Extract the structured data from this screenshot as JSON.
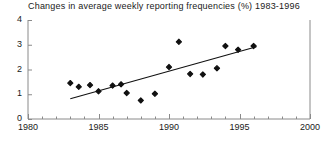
{
  "chart_data": {
    "type": "scatter",
    "title": "Changes in average weekly reporting frequencies (%) 1983-1996",
    "xlabel": "",
    "ylabel": "",
    "xlim": [
      1980,
      2000
    ],
    "ylim": [
      0,
      4
    ],
    "xticks": [
      1980,
      1985,
      1990,
      1995,
      2000
    ],
    "yticks": [
      0,
      1,
      2,
      3,
      4
    ],
    "xtick_labels": [
      "1980",
      "1985",
      "1990",
      "1995",
      "2000"
    ],
    "ytick_labels": [
      "0",
      "1",
      "2",
      "3",
      "4"
    ],
    "minor_xtick_interval": 1,
    "grid": false,
    "legend": false,
    "marker": "filled-diamond",
    "marker_color": "#111111",
    "axis_color": "#8a8a8a",
    "line_color": "#111111",
    "points": [
      {
        "x": 1983.0,
        "y": 1.45
      },
      {
        "x": 1983.6,
        "y": 1.3
      },
      {
        "x": 1984.4,
        "y": 1.37
      },
      {
        "x": 1985.0,
        "y": 1.12
      },
      {
        "x": 1986.0,
        "y": 1.35
      },
      {
        "x": 1986.6,
        "y": 1.4
      },
      {
        "x": 1987.0,
        "y": 1.05
      },
      {
        "x": 1988.0,
        "y": 0.75
      },
      {
        "x": 1989.0,
        "y": 1.02
      },
      {
        "x": 1990.0,
        "y": 2.1
      },
      {
        "x": 1990.7,
        "y": 3.12
      },
      {
        "x": 1991.5,
        "y": 1.82
      },
      {
        "x": 1992.4,
        "y": 1.8
      },
      {
        "x": 1993.4,
        "y": 2.05
      },
      {
        "x": 1994.0,
        "y": 2.95
      },
      {
        "x": 1994.9,
        "y": 2.8
      },
      {
        "x": 1996.0,
        "y": 2.95
      }
    ],
    "trend_line": {
      "type": "linear-fit",
      "x_start": 1983.0,
      "y_start": 0.82,
      "x_end": 1996.2,
      "y_end": 2.92
    }
  }
}
